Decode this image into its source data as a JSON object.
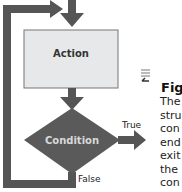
{
  "diagram": {
    "type": "flowchart-loop",
    "nodes": {
      "action": {
        "label": "Action",
        "fill": "#e6e8ea"
      },
      "condition": {
        "label": "Condition",
        "fill": "#5a5a5a"
      }
    },
    "edges": {
      "true_label": "True",
      "false_label": "False"
    },
    "colors": {
      "arrow": "#555555"
    }
  },
  "note": {
    "icon": "document-return-icon",
    "title": "Fig",
    "lines": [
      "The",
      "stru",
      "con",
      "end",
      "exit",
      "the",
      "con"
    ]
  }
}
